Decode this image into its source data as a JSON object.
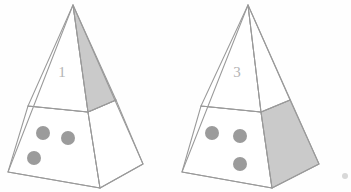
{
  "figure": {
    "background_color": "#fefefe",
    "line_color": "#9a9a9a",
    "shade_color": "#cacaca",
    "dot_color": "#9b9b9b",
    "label_color": "#b4b4b4",
    "width": 351,
    "height": 192
  },
  "pyramids": [
    {
      "id": "pyramid-left",
      "label": "1",
      "label_position": {
        "x": 62,
        "y": 74
      },
      "apex": {
        "x": 73,
        "y": 5
      },
      "base_left": {
        "x": 8,
        "y": 172
      },
      "base_front": {
        "x": 100,
        "y": 188
      },
      "base_right": {
        "x": 143,
        "y": 164
      },
      "band_left": {
        "x": 28,
        "y": 106
      },
      "band_front": {
        "x": 88,
        "y": 112
      },
      "band_right": {
        "x": 116,
        "y": 100
      },
      "shaded_face": "upper-right-triangle",
      "dot_count": 3,
      "dots": [
        {
          "cx": 43,
          "cy": 133,
          "r": 7
        },
        {
          "cx": 68,
          "cy": 138,
          "r": 7
        },
        {
          "cx": 34,
          "cy": 158,
          "r": 7
        }
      ]
    },
    {
      "id": "pyramid-right",
      "label": "3",
      "label_position": {
        "x": 237,
        "y": 74
      },
      "apex": {
        "x": 248,
        "y": 5
      },
      "base_left": {
        "x": 182,
        "y": 172
      },
      "base_front": {
        "x": 272,
        "y": 188
      },
      "base_right": {
        "x": 319,
        "y": 164
      },
      "band_left": {
        "x": 201,
        "y": 106
      },
      "band_front": {
        "x": 261,
        "y": 112
      },
      "band_right": {
        "x": 290,
        "y": 100
      },
      "shaded_face": "lower-right-frustum",
      "dot_count": 3,
      "dots": [
        {
          "cx": 212,
          "cy": 133,
          "r": 7
        },
        {
          "cx": 240,
          "cy": 136,
          "r": 7
        },
        {
          "cx": 240,
          "cy": 164,
          "r": 7
        }
      ]
    }
  ],
  "artifacts": {
    "corner_mark_label": "faint-scan-speck",
    "corner_mark": {
      "x": 345,
      "y": 176,
      "r": 3
    }
  }
}
